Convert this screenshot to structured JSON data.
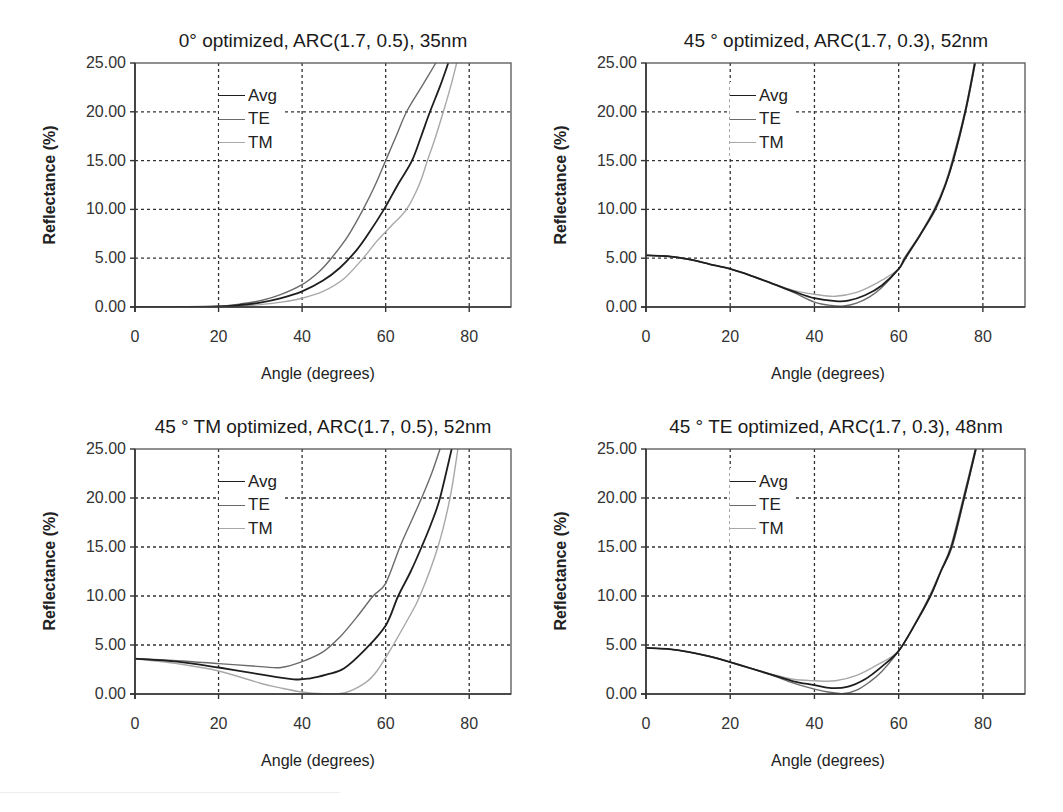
{
  "colors": {
    "Avg": "#1e1e1e",
    "TE": "#6a6a6a",
    "TM": "#a8a8a8",
    "grid": "#333333",
    "axis": "#333333"
  },
  "chart_data": [
    {
      "type": "line",
      "title": "0° optimized, ARC(1.7, 0.5), 35nm",
      "xlabel": "Angle (degrees)",
      "ylabel": "Reflectance (%)",
      "xlim": [
        0,
        90
      ],
      "ylim": [
        0,
        25
      ],
      "xticks": [
        "0",
        "20",
        "40",
        "60",
        "80"
      ],
      "yticks": [
        "0.00",
        "5.00",
        "10.00",
        "15.00",
        "20.00",
        "25.00"
      ],
      "grid": true,
      "legend": {
        "position": "upper-left-center",
        "entries": [
          "Avg",
          "TE",
          "TM"
        ]
      },
      "series": [
        {
          "name": "Avg",
          "x": [
            0,
            10,
            20,
            25,
            30,
            35,
            40,
            45,
            49,
            53,
            56,
            59.6,
            63,
            66.3,
            68.5,
            70.6,
            73,
            75
          ],
          "y": [
            0,
            0,
            0.05,
            0.2,
            0.45,
            0.9,
            1.6,
            2.7,
            4.0,
            5.8,
            7.6,
            10,
            12.6,
            15,
            17.5,
            20,
            22.6,
            25
          ]
        },
        {
          "name": "TE",
          "x": [
            0,
            10,
            20,
            25,
            30,
            35,
            40,
            44,
            47,
            51,
            54.6,
            57.5,
            60,
            62.5,
            65,
            68.5,
            72
          ],
          "y": [
            0,
            0,
            0.07,
            0.3,
            0.65,
            1.3,
            2.3,
            3.6,
            5,
            7.3,
            10,
            12.5,
            15,
            17.5,
            20,
            22.5,
            25
          ]
        },
        {
          "name": "TM",
          "x": [
            0,
            10,
            20,
            25,
            30,
            35,
            40,
            45,
            50,
            54.6,
            58,
            62,
            65,
            68,
            70,
            72,
            73.8,
            75.5,
            77
          ],
          "y": [
            0,
            0,
            0.03,
            0.1,
            0.25,
            0.5,
            0.9,
            1.6,
            2.9,
            5,
            6.8,
            8.6,
            10,
            12.5,
            15,
            17.5,
            20,
            22.5,
            25
          ]
        }
      ]
    },
    {
      "type": "line",
      "title": "45 ° optimized, ARC(1.7, 0.3), 52nm",
      "xlabel": "Angle (degrees)",
      "ylabel": "Reflectance (%)",
      "xlim": [
        0,
        90
      ],
      "ylim": [
        0,
        25
      ],
      "xticks": [
        "0",
        "20",
        "40",
        "60",
        "80"
      ],
      "yticks": [
        "0.00",
        "5.00",
        "10.00",
        "15.00",
        "20.00",
        "25.00"
      ],
      "grid": true,
      "legend": {
        "position": "upper-left-center",
        "entries": [
          "Avg",
          "TE",
          "TM"
        ]
      },
      "series": [
        {
          "name": "Avg",
          "x": [
            0,
            5,
            10,
            15,
            20,
            25,
            30,
            35,
            40,
            45,
            48,
            52,
            56,
            60,
            61.5,
            65,
            68.6,
            71,
            72.9,
            75.8,
            78.1
          ],
          "y": [
            5.3,
            5.2,
            4.9,
            4.4,
            3.9,
            3.2,
            2.4,
            1.6,
            0.9,
            0.6,
            0.65,
            1.2,
            2.2,
            3.9,
            5,
            7.3,
            10,
            12.4,
            15,
            20,
            25
          ]
        },
        {
          "name": "TE",
          "x": [
            0,
            5,
            10,
            15,
            20,
            25,
            30,
            35,
            40,
            44,
            47,
            50,
            53,
            56,
            60,
            61.7,
            65,
            68.8,
            71,
            73,
            75.9,
            78.2
          ],
          "y": [
            5.3,
            5.2,
            4.9,
            4.4,
            3.9,
            3.2,
            2.4,
            1.5,
            0.5,
            0.15,
            0.1,
            0.4,
            1.0,
            2.0,
            3.9,
            5,
            7.3,
            10,
            12.4,
            15,
            20,
            25
          ]
        },
        {
          "name": "TM",
          "x": [
            0,
            5,
            10,
            15,
            20,
            25,
            30,
            35,
            40,
            45,
            50,
            55,
            60,
            61.3,
            65,
            68.4,
            71,
            72.7,
            75.7,
            78
          ],
          "y": [
            5.3,
            5.2,
            4.9,
            4.4,
            3.9,
            3.2,
            2.4,
            1.7,
            1.3,
            1.1,
            1.5,
            2.5,
            3.9,
            5,
            7.4,
            10,
            12.6,
            15,
            20,
            25
          ]
        }
      ]
    },
    {
      "type": "line",
      "title": "45 ° TM optimized, ARC(1.7, 0.5), 52nm",
      "xlabel": "Angle (degrees)",
      "ylabel": "Reflectance (%)",
      "xlim": [
        0,
        90
      ],
      "ylim": [
        0,
        25
      ],
      "xticks": [
        "0",
        "20",
        "40",
        "60",
        "80"
      ],
      "yticks": [
        "0.00",
        "5.00",
        "10.00",
        "15.00",
        "20.00",
        "25.00"
      ],
      "grid": true,
      "legend": {
        "position": "upper-left-center",
        "entries": [
          "Avg",
          "TE",
          "TM"
        ]
      },
      "series": [
        {
          "name": "Avg",
          "x": [
            0,
            10,
            20,
            30,
            38,
            42,
            46,
            50,
            55,
            60,
            63,
            66,
            68.6,
            71,
            73,
            75.8
          ],
          "y": [
            3.6,
            3.3,
            2.7,
            2.0,
            1.5,
            1.6,
            2.0,
            2.6,
            4.5,
            7.0,
            10,
            12.5,
            15,
            17.5,
            20,
            25
          ]
        },
        {
          "name": "TE",
          "x": [
            0,
            10,
            20,
            30,
            35,
            40,
            45,
            49,
            53,
            57,
            60,
            63.4,
            66,
            68.6,
            71,
            73
          ],
          "y": [
            3.6,
            3.4,
            3.1,
            2.8,
            2.7,
            3.3,
            4.3,
            5.8,
            7.8,
            10,
            11.3,
            15,
            17.5,
            20,
            22.5,
            25
          ]
        },
        {
          "name": "TM",
          "x": [
            0,
            10,
            20,
            30,
            35,
            40,
            45,
            50,
            55,
            58,
            61.8,
            65,
            68.2,
            72.5,
            75.4,
            77.3
          ],
          "y": [
            3.6,
            3.1,
            2.35,
            1.1,
            0.6,
            0.2,
            0.02,
            0.1,
            1.1,
            2.4,
            5,
            7.4,
            10,
            15,
            20,
            25
          ]
        }
      ]
    },
    {
      "type": "line",
      "title": "45 ° TE optimized, ARC(1.7, 0.3), 48nm",
      "xlabel": "Angle (degrees)",
      "ylabel": "Reflectance (%)",
      "xlim": [
        0,
        90
      ],
      "ylim": [
        0,
        25
      ],
      "xticks": [
        "0",
        "20",
        "40",
        "60",
        "80"
      ],
      "yticks": [
        "0.00",
        "5.00",
        "10.00",
        "15.00",
        "20.00",
        "25.00"
      ],
      "grid": true,
      "legend": {
        "position": "upper-left-center",
        "entries": [
          "Avg",
          "TE",
          "TM"
        ]
      },
      "series": [
        {
          "name": "Avg",
          "x": [
            0,
            5,
            10,
            15,
            20,
            25,
            30,
            35,
            40,
            44,
            48,
            52,
            56,
            60,
            64,
            67.5,
            70,
            72.5,
            75.5,
            78.3
          ],
          "y": [
            4.7,
            4.6,
            4.3,
            3.85,
            3.25,
            2.6,
            1.95,
            1.3,
            0.9,
            0.6,
            0.75,
            1.5,
            2.8,
            4.4,
            7.2,
            10,
            12.5,
            15,
            20,
            25
          ]
        },
        {
          "name": "TE",
          "x": [
            0,
            5,
            10,
            15,
            20,
            25,
            30,
            35,
            40,
            44,
            47,
            50,
            53,
            56,
            60,
            64,
            67.6,
            70,
            72.7,
            75.6,
            78.4
          ],
          "y": [
            4.7,
            4.6,
            4.3,
            3.85,
            3.25,
            2.6,
            1.9,
            1.1,
            0.5,
            0.15,
            0.05,
            0.4,
            1.2,
            2.3,
            4.4,
            7.2,
            10,
            12.5,
            15,
            20,
            25
          ]
        },
        {
          "name": "TM",
          "x": [
            0,
            5,
            10,
            15,
            20,
            25,
            30,
            35,
            40,
            45,
            50,
            55,
            60,
            64,
            67.3,
            70,
            72.3,
            75.3,
            78.2
          ],
          "y": [
            4.7,
            4.6,
            4.3,
            3.85,
            3.25,
            2.6,
            2.0,
            1.5,
            1.35,
            1.35,
            1.9,
            3.0,
            4.4,
            7.3,
            10,
            12.6,
            15,
            20,
            25
          ]
        }
      ]
    }
  ],
  "panels": [
    {
      "title": "0° optimized, ARC(1.7, 0.5), 35nm",
      "xlabel": "Angle (degrees)",
      "ylabel": "Reflectance (%)",
      "legend": [
        "Avg",
        "TE",
        "TM"
      ]
    },
    {
      "title": "45 ° optimized, ARC(1.7, 0.3), 52nm",
      "xlabel": "Angle (degrees)",
      "ylabel": "Reflectance (%)",
      "legend": [
        "Avg",
        "TE",
        "TM"
      ]
    },
    {
      "title": "45 ° TM optimized, ARC(1.7, 0.5), 52nm",
      "xlabel": "Angle (degrees)",
      "ylabel": "Reflectance (%)",
      "legend": [
        "Avg",
        "TE",
        "TM"
      ]
    },
    {
      "title": "45 ° TE optimized, ARC(1.7, 0.3), 48nm",
      "xlabel": "Angle (degrees)",
      "ylabel": "Reflectance (%)",
      "legend": [
        "Avg",
        "TE",
        "TM"
      ]
    }
  ]
}
